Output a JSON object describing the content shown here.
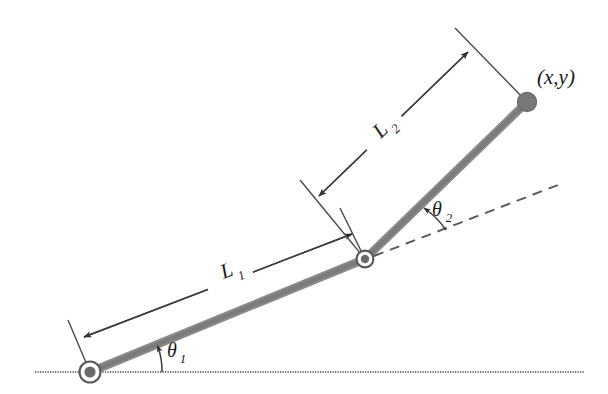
{
  "figure": {
    "background_color": "#ffffff",
    "labels": {
      "link1_length": "L",
      "link1_length_sub": "1",
      "link2_length": "L",
      "link2_length_sub": "2",
      "angle1": "θ",
      "angle1_sub": "1",
      "angle2": "θ",
      "angle2_sub": "2",
      "endpoint": "(x,y)"
    },
    "colors": {
      "link": "#808080",
      "line": "#4a4a4a",
      "text": "#1a1a1a",
      "joint_ring": "#555555",
      "joint_fill": "#707070"
    },
    "geometry": {
      "base_joint": {
        "x": 90,
        "y": 372
      },
      "elbow_joint": {
        "x": 365,
        "y": 259
      },
      "end_effector": {
        "x": 527,
        "y": 102
      },
      "ground_line": {
        "x1": 35,
        "y1": 372,
        "x2": 585,
        "y2": 372
      },
      "extension_dashed_line": {
        "x1": 372,
        "y1": 257,
        "x2": 562,
        "y2": 184
      },
      "link1_dimension": {
        "x1": 82,
        "y1": 338,
        "x2": 350,
        "y2": 232
      },
      "link2_dimension": {
        "x1": 317,
        "y1": 198,
        "x2": 470,
        "y2": 50
      },
      "angle1_degrees": 22,
      "angle2_degrees": 23
    }
  }
}
